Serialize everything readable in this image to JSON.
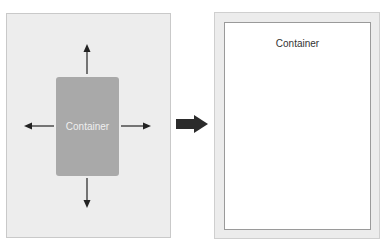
{
  "before": {
    "container_label": "Container",
    "colors": {
      "panel": "#ededed",
      "container": "#a9a9a9",
      "arrow": "#222222"
    },
    "expand_directions": [
      "up",
      "down",
      "left",
      "right"
    ]
  },
  "transition": {
    "icon": "right-arrow-icon"
  },
  "after": {
    "container_label": "Container",
    "colors": {
      "outer": "#ececec",
      "inner": "#ffffff"
    }
  }
}
